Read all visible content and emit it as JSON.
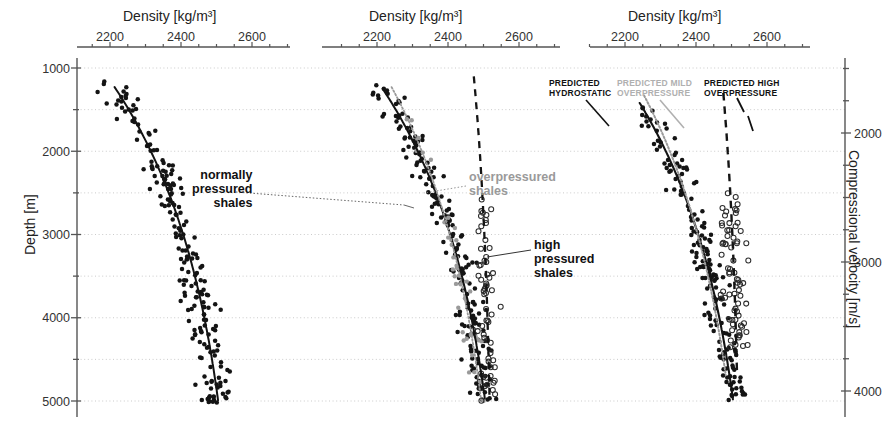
{
  "figure": {
    "left_axis_title": "Depth [m]",
    "right_axis_title": "Compressional velocity [m/s]",
    "density_axis_title": "Density [kg/m³]",
    "density_ticks": [
      "2200",
      "2400",
      "2600"
    ],
    "depth_ticks": [
      "1000",
      "2000",
      "3000",
      "4000",
      "5000"
    ],
    "velocity_ticks": [
      "2000",
      "3000",
      "4000"
    ]
  },
  "annotations": {
    "normally_pressured": "normally\npressured\nshales",
    "overpressured": "overpressured\nshales",
    "high_pressured": "high\npressured\nshales",
    "predicted_hydrostatic": "PREDICTED\nHYDROSTATIC",
    "predicted_mild": "PREDICTED MILD\nOVERPRESSURE",
    "predicted_high": "PREDICTED HIGH\nOVERPRESSURE"
  },
  "colors": {
    "black": "#141414",
    "gray": "#9a9a9a",
    "grid": "#c8c8c8",
    "axis": "#555555"
  },
  "chart_data": {
    "type": "scatter",
    "xlabel": "Density [kg/m³]",
    "ylabel": "Depth [m]",
    "y2label": "Compressional velocity [m/s]",
    "xlim": [
      2100,
      2700
    ],
    "ylim": [
      5200,
      900
    ],
    "y2lim": [
      1400,
      4300
    ],
    "grid": true,
    "legend": "annotations in-plot",
    "panels": [
      {
        "name": "panel-1-normally-pressured",
        "series": [
          {
            "name": "normally pressured shales",
            "marker": "filled-circle",
            "color": "#141414",
            "points": [
              [
                2253,
                1240
              ],
              [
                2213,
                1480
              ],
              [
                2232,
                1520
              ],
              [
                2268,
                1560
              ],
              [
                2208,
                1600
              ],
              [
                2245,
                1620
              ],
              [
                2288,
                1600
              ],
              [
                2196,
                1660
              ],
              [
                2236,
                1680
              ],
              [
                2264,
                1700
              ],
              [
                2300,
                1690
              ],
              [
                2224,
                1740
              ],
              [
                2252,
                1760
              ],
              [
                2276,
                1780
              ],
              [
                2320,
                1770
              ],
              [
                2212,
                1820
              ],
              [
                2244,
                1840
              ],
              [
                2268,
                1860
              ],
              [
                2292,
                1850
              ],
              [
                2232,
                1900
              ],
              [
                2256,
                1920
              ],
              [
                2284,
                1940
              ],
              [
                2312,
                1930
              ],
              [
                2188,
                1960
              ],
              [
                2248,
                1990
              ],
              [
                2272,
                2010
              ],
              [
                2296,
                2030
              ],
              [
                2236,
                2060
              ],
              [
                2260,
                2080
              ],
              [
                2284,
                2100
              ],
              [
                2308,
                2120
              ],
              [
                2340,
                2100
              ],
              [
                2252,
                2160
              ],
              [
                2276,
                2180
              ],
              [
                2300,
                2200
              ],
              [
                2324,
                2190
              ],
              [
                2240,
                2250
              ],
              [
                2264,
                2270
              ],
              [
                2292,
                2290
              ],
              [
                2316,
                2280
              ],
              [
                2356,
                2260
              ],
              [
                2260,
                2340
              ],
              [
                2284,
                2360
              ],
              [
                2308,
                2380
              ],
              [
                2332,
                2370
              ],
              [
                2372,
                2340
              ],
              [
                2272,
                2430
              ],
              [
                2296,
                2450
              ],
              [
                2320,
                2470
              ],
              [
                2344,
                2460
              ],
              [
                2388,
                2430
              ],
              [
                2284,
                2520
              ],
              [
                2308,
                2540
              ],
              [
                2332,
                2560
              ],
              [
                2356,
                2550
              ],
              [
                2396,
                2530
              ],
              [
                2292,
                2610
              ],
              [
                2316,
                2630
              ],
              [
                2340,
                2650
              ],
              [
                2368,
                2640
              ],
              [
                2404,
                2610
              ],
              [
                2300,
                2700
              ],
              [
                2328,
                2720
              ],
              [
                2352,
                2740
              ],
              [
                2376,
                2730
              ],
              [
                2416,
                2700
              ],
              [
                2312,
                2790
              ],
              [
                2336,
                2810
              ],
              [
                2360,
                2830
              ],
              [
                2384,
                2820
              ],
              [
                2424,
                2790
              ],
              [
                2320,
                2880
              ],
              [
                2348,
                2900
              ],
              [
                2372,
                2920
              ],
              [
                2396,
                2910
              ],
              [
                2436,
                2880
              ],
              [
                2332,
                2970
              ],
              [
                2356,
                2990
              ],
              [
                2380,
                3010
              ],
              [
                2408,
                3000
              ],
              [
                2444,
                2970
              ],
              [
                2344,
                3060
              ],
              [
                2368,
                3080
              ],
              [
                2392,
                3100
              ],
              [
                2420,
                3090
              ],
              [
                2456,
                3060
              ],
              [
                2356,
                3150
              ],
              [
                2380,
                3170
              ],
              [
                2404,
                3190
              ],
              [
                2432,
                3180
              ],
              [
                2468,
                3150
              ],
              [
                2364,
                3240
              ],
              [
                2392,
                3260
              ],
              [
                2416,
                3280
              ],
              [
                2444,
                3270
              ],
              [
                2480,
                3240
              ],
              [
                2376,
                3330
              ],
              [
                2400,
                3350
              ],
              [
                2428,
                3370
              ],
              [
                2456,
                3360
              ],
              [
                2492,
                3330
              ],
              [
                2388,
                3420
              ],
              [
                2412,
                3440
              ],
              [
                2440,
                3460
              ],
              [
                2468,
                3450
              ],
              [
                2504,
                3420
              ],
              [
                2396,
                3510
              ],
              [
                2424,
                3530
              ],
              [
                2448,
                3550
              ],
              [
                2476,
                3540
              ],
              [
                2512,
                3510
              ],
              [
                2408,
                3600
              ],
              [
                2432,
                3620
              ],
              [
                2460,
                3640
              ],
              [
                2488,
                3630
              ],
              [
                2524,
                3600
              ],
              [
                2416,
                3690
              ],
              [
                2444,
                3710
              ],
              [
                2468,
                3730
              ],
              [
                2496,
                3720
              ],
              [
                2532,
                3690
              ],
              [
                2428,
                3790
              ],
              [
                2452,
                3810
              ],
              [
                2480,
                3830
              ],
              [
                2508,
                3820
              ],
              [
                2544,
                3790
              ],
              [
                2436,
                3890
              ],
              [
                2464,
                3910
              ],
              [
                2488,
                3930
              ],
              [
                2516,
                3920
              ],
              [
                2552,
                3890
              ],
              [
                2448,
                3990
              ],
              [
                2472,
                4010
              ],
              [
                2500,
                4030
              ],
              [
                2528,
                4020
              ],
              [
                2560,
                3990
              ],
              [
                2456,
                4100
              ],
              [
                2484,
                4120
              ],
              [
                2508,
                4140
              ],
              [
                2536,
                4130
              ],
              [
                2464,
                4220
              ],
              [
                2492,
                4240
              ],
              [
                2516,
                4260
              ],
              [
                2544,
                4250
              ],
              [
                2472,
                4350
              ],
              [
                2500,
                4370
              ],
              [
                2524,
                4390
              ],
              [
                2552,
                4380
              ],
              [
                2480,
                4480
              ],
              [
                2508,
                4500
              ],
              [
                2532,
                4520
              ],
              [
                2488,
                4610
              ],
              [
                2516,
                4630
              ],
              [
                2540,
                4650
              ],
              [
                2496,
                4740
              ],
              [
                2524,
                4760
              ],
              [
                2548,
                4780
              ],
              [
                2504,
                4870
              ],
              [
                2528,
                4890
              ],
              [
                2552,
                4910
              ],
              [
                2512,
                4980
              ],
              [
                2536,
                5000
              ],
              [
                2380,
                2520
              ],
              [
                2420,
                2600
              ],
              [
                2512,
                2640
              ],
              [
                2500,
                2740
              ],
              [
                2468,
                2860
              ],
              [
                2496,
                2880
              ],
              [
                2540,
                2900
              ],
              [
                2560,
                3060
              ],
              [
                2572,
                3180
              ],
              [
                2556,
                3300
              ],
              [
                2584,
                3360
              ],
              [
                2560,
                3480
              ],
              [
                2176,
                2340
              ],
              [
                2200,
                2500
              ],
              [
                2228,
                2600
              ],
              [
                2160,
                2660
              ],
              [
                2196,
                2760
              ],
              [
                2232,
                2840
              ]
            ]
          }
        ],
        "trend_curves": [
          {
            "name": "hydrostatic-trend",
            "style": "solid",
            "color": "#141414"
          }
        ]
      },
      {
        "name": "panel-2-observed-populations",
        "series": [
          {
            "name": "normally pressured shales",
            "marker": "filled-circle",
            "color": "#141414"
          },
          {
            "name": "overpressured shales",
            "marker": "gray-circle",
            "color": "#9a9a9a"
          },
          {
            "name": "high pressured shales",
            "marker": "open-circle",
            "color": "#333333"
          }
        ],
        "trend_curves": [
          {
            "name": "normally-pressured-trend",
            "style": "solid",
            "color": "#141414"
          },
          {
            "name": "overpressured-trend",
            "style": "dotted",
            "color": "#9a9a9a"
          },
          {
            "name": "high-pressured-trend",
            "style": "dashed",
            "color": "#141414"
          }
        ]
      },
      {
        "name": "panel-3-predicted-trends",
        "series": [
          {
            "name": "normally pressured shales",
            "marker": "filled-circle",
            "color": "#141414"
          },
          {
            "name": "high pressured shales",
            "marker": "open-circle",
            "color": "#333333"
          }
        ],
        "trend_curves": [
          {
            "name": "predicted-hydrostatic",
            "style": "solid",
            "color": "#141414"
          },
          {
            "name": "predicted-mild-overpressure",
            "style": "dotted",
            "color": "#9a9a9a"
          },
          {
            "name": "predicted-high-overpressure",
            "style": "dashed",
            "color": "#141414"
          }
        ]
      }
    ]
  }
}
